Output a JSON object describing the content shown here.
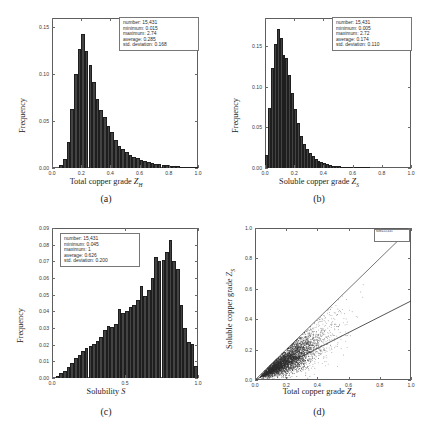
{
  "figure": {
    "panels": [
      "a",
      "b",
      "c",
      "d"
    ],
    "bar_color": "#434343",
    "axis_color": "#5d5d5d"
  },
  "captions": {
    "a": "(a)",
    "b": "(b)",
    "c": "(c)",
    "d": "(d)"
  },
  "labels": {
    "frequency": "Frequency",
    "total_copper_pre": "Total copper grade ",
    "total_copper_sym": "Z",
    "total_copper_sub": "H",
    "soluble_copper_pre": "Soluble copper grade ",
    "soluble_copper_sym": "Z",
    "soluble_copper_sub": "S",
    "solubility_pre": "Solubility ",
    "solubility_sym": "S"
  },
  "stats": {
    "a": {
      "number": "number: 15,431",
      "minimum": "minimum: 0.015",
      "maximum": "maximum: 2.74",
      "average": "average: 0.285",
      "std": "std. deviation: 0.168"
    },
    "b": {
      "number": "number: 15,431",
      "minimum": "minimum: 0.005",
      "maximum": "maximum: 2.72",
      "average": "average: 0.174",
      "std": "std. deviation: 0.110"
    },
    "c": {
      "number": "number: 15,431",
      "minimum": "minimum: 0.045",
      "maximum": "maximum: 1",
      "average": "average: 0.626",
      "std": "std. deviation: 0.200"
    },
    "d": {
      "legend": "size=15,431"
    }
  },
  "chart_data": [
    {
      "panel": "a",
      "type": "bar",
      "title": "",
      "xlabel": "Total copper grade Z_H",
      "ylabel": "Frequency",
      "xlim": [
        0.0,
        1.0
      ],
      "ylim": [
        0.0,
        0.16
      ],
      "xticks": [
        0.0,
        0.2,
        0.4,
        0.6,
        0.8,
        1.0
      ],
      "xticklabels": [
        "0.0",
        "0.2",
        "0.4",
        "0.6",
        "0.8",
        "1.0"
      ],
      "yticks": [
        0.0,
        0.05,
        0.1,
        0.15
      ],
      "yticklabels": [
        "0.00",
        "0.05",
        "0.10",
        "0.15"
      ],
      "grid": false,
      "legend_position": "top-right",
      "bin_width": 0.025,
      "bin_starts": [
        0.05,
        0.075,
        0.1,
        0.125,
        0.15,
        0.175,
        0.2,
        0.225,
        0.25,
        0.275,
        0.3,
        0.325,
        0.35,
        0.375,
        0.4,
        0.425,
        0.45,
        0.475,
        0.5,
        0.525,
        0.55,
        0.575,
        0.6,
        0.625,
        0.65,
        0.675,
        0.7,
        0.725,
        0.75,
        0.775,
        0.8,
        0.825,
        0.85,
        0.875,
        0.9,
        0.925,
        0.95,
        0.975
      ],
      "values": [
        0.003,
        0.01,
        0.028,
        0.063,
        0.1,
        0.127,
        0.143,
        0.125,
        0.11,
        0.092,
        0.074,
        0.062,
        0.054,
        0.045,
        0.038,
        0.03,
        0.024,
        0.02,
        0.017,
        0.014,
        0.012,
        0.0105,
        0.009,
        0.0078,
        0.0065,
        0.0056,
        0.0048,
        0.004,
        0.0034,
        0.0029,
        0.0024,
        0.002,
        0.0017,
        0.0014,
        0.0012,
        0.001,
        0.0008,
        0.0006
      ]
    },
    {
      "panel": "b",
      "type": "bar",
      "title": "",
      "xlabel": "Soluble copper grade Z_S",
      "ylabel": "Frequency",
      "xlim": [
        0.0,
        1.0
      ],
      "ylim": [
        0.0,
        0.185
      ],
      "xticks": [
        0.0,
        0.2,
        0.4,
        0.6,
        0.8,
        1.0
      ],
      "xticklabels": [
        "0.0",
        "0.2",
        "0.4",
        "0.6",
        "0.8",
        "1.0"
      ],
      "yticks": [
        0.0,
        0.05,
        0.1,
        0.15
      ],
      "yticklabels": [
        "0.00",
        "0.05",
        "0.10",
        "0.15"
      ],
      "grid": false,
      "legend_position": "top-right",
      "bin_width": 0.02,
      "bin_starts": [
        0.0,
        0.02,
        0.04,
        0.06,
        0.08,
        0.1,
        0.12,
        0.14,
        0.16,
        0.18,
        0.2,
        0.22,
        0.24,
        0.26,
        0.28,
        0.3,
        0.32,
        0.34,
        0.36,
        0.38,
        0.4,
        0.42,
        0.44,
        0.46,
        0.48,
        0.5,
        0.52,
        0.54,
        0.56,
        0.58,
        0.6,
        0.62,
        0.64,
        0.66,
        0.68,
        0.7
      ],
      "values": [
        0.016,
        0.074,
        0.123,
        0.153,
        0.172,
        0.16,
        0.139,
        0.136,
        0.115,
        0.092,
        0.073,
        0.055,
        0.04,
        0.03,
        0.023,
        0.018,
        0.0145,
        0.0115,
        0.0092,
        0.0074,
        0.006,
        0.0048,
        0.0039,
        0.0031,
        0.0026,
        0.0021,
        0.0017,
        0.0014,
        0.0011,
        0.0009,
        0.0007,
        0.0006,
        0.0005,
        0.0004,
        0.0003,
        0.0002
      ]
    },
    {
      "panel": "c",
      "type": "bar",
      "title": "",
      "xlabel": "Solubility S",
      "ylabel": "Frequency",
      "xlim": [
        0.0,
        1.0
      ],
      "ylim": [
        0.0,
        0.09
      ],
      "xticks": [
        0.0,
        0.5,
        1.0
      ],
      "xticklabels": [
        "0.0",
        "0.5",
        "1.0"
      ],
      "yticks": [
        0.0,
        0.01,
        0.02,
        0.03,
        0.04,
        0.05,
        0.06,
        0.07,
        0.08,
        0.09
      ],
      "yticklabels": [
        "0.00",
        "0.01",
        "0.02",
        "0.03",
        "0.04",
        "0.05",
        "0.06",
        "0.07",
        "0.08",
        "0.09"
      ],
      "grid": false,
      "legend_position": "top-left",
      "bin_width": 0.025,
      "bin_starts": [
        0.025,
        0.05,
        0.075,
        0.1,
        0.125,
        0.15,
        0.175,
        0.2,
        0.225,
        0.25,
        0.275,
        0.3,
        0.325,
        0.35,
        0.375,
        0.4,
        0.425,
        0.45,
        0.475,
        0.5,
        0.525,
        0.55,
        0.575,
        0.6,
        0.625,
        0.65,
        0.675,
        0.7,
        0.725,
        0.75,
        0.775,
        0.8,
        0.825,
        0.85,
        0.875,
        0.9,
        0.925,
        0.95,
        0.975
      ],
      "values": [
        0.0012,
        0.0028,
        0.0045,
        0.0068,
        0.0092,
        0.0118,
        0.014,
        0.016,
        0.0178,
        0.0192,
        0.0205,
        0.0222,
        0.0245,
        0.029,
        0.031,
        0.0305,
        0.0322,
        0.0415,
        0.0392,
        0.04,
        0.0428,
        0.044,
        0.047,
        0.055,
        0.0495,
        0.053,
        0.06,
        0.0725,
        0.07,
        0.071,
        0.0755,
        0.083,
        0.07,
        0.0655,
        0.044,
        0.03,
        0.0215,
        0.0205,
        0.007
      ]
    },
    {
      "panel": "d",
      "type": "scatter",
      "title": "",
      "xlabel": "Total copper grade Z_H",
      "ylabel": "Soluble copper grade Z_S",
      "xlim": [
        0.0,
        1.0
      ],
      "ylim": [
        0.0,
        1.0
      ],
      "xticks": [
        0.0,
        0.2,
        0.4,
        0.6,
        0.8,
        1.0
      ],
      "xticklabels": [
        "0.0",
        "0.2",
        "0.4",
        "0.6",
        "0.8",
        "1.0"
      ],
      "yticks": [
        0.0,
        0.2,
        0.4,
        0.6,
        0.8,
        1.0
      ],
      "yticklabels": [
        "0.0",
        "0.2",
        "0.4",
        "0.6",
        "0.8",
        "1.0"
      ],
      "grid": false,
      "legend_position": "top-right",
      "n_points": 15431,
      "upper_bound_line": {
        "from": [
          0.0,
          0.0
        ],
        "to": [
          1.0,
          1.0
        ],
        "note": "Z_S = Z_H"
      },
      "lower_trend_line": {
        "from": [
          0.0,
          0.0
        ],
        "to": [
          1.0,
          0.52
        ]
      },
      "cloud_note": "dense wedge below the 1:1 line, widening with Z_H"
    }
  ]
}
